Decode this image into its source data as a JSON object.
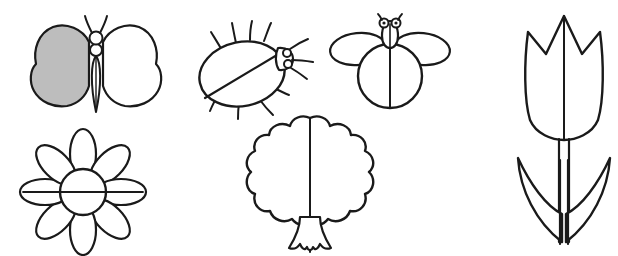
{
  "page": {
    "background_color": "#ffffff",
    "ink_color": "#1a1a1a",
    "shade_color": "#bdbdbd",
    "width": 618,
    "height": 256,
    "style": "black and white outline clip-art, hand-drawn line art"
  },
  "figures": [
    {
      "id": "butterfly",
      "label": "Butterfly",
      "description": "Symmetrical butterfly with two large lobed wings, segmented body, and two curved antennae. The left wing is filled with gray shading; the right wing is white.",
      "row": 1,
      "column": 1,
      "shaded": true,
      "shade_color": "#bdbdbd",
      "parts": [
        "left-wing",
        "right-wing",
        "head",
        "thorax",
        "abdomen",
        "antennae"
      ]
    },
    {
      "id": "beetle",
      "label": "Beetle",
      "description": "Oval-bodied beetle tilted with a diagonal wing-split line across the body, a small head with eyes and antennae at the upper right, and six thin legs radiating outward.",
      "row": 1,
      "column": 2,
      "shaded": false,
      "parts": [
        "body",
        "wing-split-line",
        "head",
        "eyes",
        "antennae",
        "legs"
      ]
    },
    {
      "id": "bee",
      "label": "Bee",
      "description": "Bee seen from above with a round body divided by a vertical center line, two horizontal oval wings, and a small head with two round eyes and short antennae.",
      "row": 1,
      "column": 3,
      "shaded": false,
      "parts": [
        "body",
        "center-line",
        "left-wing",
        "right-wing",
        "head",
        "eyes",
        "antennae"
      ]
    },
    {
      "id": "daisy",
      "label": "Daisy flower",
      "description": "Flower with eight long oval petals radiating from a round center disc, with a horizontal line running through the petals and center.",
      "row": 2,
      "column": 1,
      "shaded": false,
      "petal_count": 8,
      "parts": [
        "petals",
        "center-disc",
        "horizontal-line"
      ]
    },
    {
      "id": "tree",
      "label": "Tree",
      "description": "Broadleaf tree with a scalloped cloud-shaped canopy, a vertical center line down the middle, and a short trunk that flares into notched roots.",
      "row": 2,
      "column": 2,
      "shaded": false,
      "parts": [
        "canopy",
        "center-line",
        "trunk",
        "roots"
      ]
    },
    {
      "id": "tulip",
      "label": "Tulip",
      "description": "Tulip with a three-pointed cup-shaped bloom, a vertical line through the flower, a straight double-line stem, and two pointed leaves forming a V below.",
      "row": 1,
      "column": 4,
      "shaded": false,
      "parts": [
        "bloom",
        "center-line",
        "stem",
        "left-leaf",
        "right-leaf"
      ]
    }
  ]
}
